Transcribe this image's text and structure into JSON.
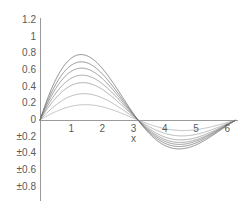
{
  "chart_data": {
    "type": "line",
    "title": "",
    "subtitle": "",
    "xlabel": "x",
    "ylabel": "",
    "xlim": [
      0,
      6.25
    ],
    "ylim": [
      -0.9,
      1.2
    ],
    "grid": false,
    "legend": false,
    "legend_position": "none",
    "background_color": "#ffffff",
    "axis_color": "#909090",
    "tick_label_color": "#5a5a5a",
    "x_ticks": [
      {
        "value": 1,
        "label": "1"
      },
      {
        "value": 2,
        "label": "2"
      },
      {
        "value": 3,
        "label": "3"
      },
      {
        "value": 4,
        "label": "4"
      },
      {
        "value": 5,
        "label": "5"
      },
      {
        "value": 6,
        "label": "6"
      }
    ],
    "y_ticks": [
      {
        "value": 1.2,
        "label": "1.2"
      },
      {
        "value": 1.0,
        "label": "1"
      },
      {
        "value": 0.8,
        "label": "0.8"
      },
      {
        "value": 0.6,
        "label": "0.6"
      },
      {
        "value": 0.4,
        "label": "0.4"
      },
      {
        "value": 0.2,
        "label": "0.2"
      },
      {
        "value": 0.0,
        "label": "0"
      },
      {
        "value": -0.2,
        "label": "±0.2"
      },
      {
        "value": -0.4,
        "label": "±0.4"
      },
      {
        "value": -0.6,
        "label": "±0.6"
      },
      {
        "value": -0.8,
        "label": "±0.8"
      }
    ],
    "series": [
      {
        "name": "curve-1",
        "color": "#a8a8a8",
        "amplitude": 0.22,
        "damping": 0.12,
        "peaks": [
          0.21,
          0.16,
          0.13,
          0.1
        ],
        "troughs": [
          -0.19,
          -0.15,
          -0.12
        ]
      },
      {
        "name": "curve-2",
        "color": "#9d9d9d",
        "amplitude": 0.4,
        "damping": 0.16,
        "peaks": [
          0.38,
          0.27,
          0.2,
          0.14
        ],
        "troughs": [
          -0.32,
          -0.23,
          -0.17
        ]
      },
      {
        "name": "curve-3",
        "color": "#8f8f8f",
        "amplitude": 0.6,
        "damping": 0.2,
        "peaks": [
          0.56,
          0.37,
          0.25,
          0.16
        ],
        "troughs": [
          -0.46,
          -0.3,
          -0.2
        ]
      },
      {
        "name": "curve-4",
        "color": "#848484",
        "amplitude": 0.74,
        "damping": 0.22,
        "peaks": [
          0.69,
          0.44,
          0.28,
          0.17
        ],
        "troughs": [
          -0.56,
          -0.35,
          -0.22
        ]
      },
      {
        "name": "curve-5",
        "color": "#787878",
        "amplitude": 0.88,
        "damping": 0.24,
        "peaks": [
          0.82,
          0.5,
          0.3,
          0.18
        ],
        "troughs": [
          -0.66,
          -0.39,
          -0.23
        ]
      },
      {
        "name": "curve-6",
        "color": "#6e6e6e",
        "amplitude": 1.0,
        "damping": 0.25,
        "peaks": [
          0.94,
          0.56,
          0.33,
          0.19
        ],
        "troughs": [
          -0.74,
          -0.42,
          -0.24
        ]
      },
      {
        "name": "curve-7",
        "color": "#646464",
        "amplitude": 1.14,
        "damping": 0.26,
        "peaks": [
          1.07,
          0.62,
          0.36,
          0.2
        ],
        "troughs": [
          -0.82,
          -0.46,
          -0.26
        ]
      }
    ]
  },
  "geometry": {
    "plot_left_px": 40,
    "plot_right_px": 232,
    "zero_y_px": 120,
    "top_y_px": 20,
    "axis_bottom_px": 201,
    "px_per_x_unit": 31.2,
    "px_per_y_unit": 83.5
  }
}
